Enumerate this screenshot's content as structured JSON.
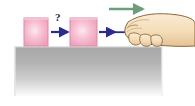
{
  "figure": {
    "background_color": "#ffffff",
    "width": 195,
    "height": 106
  },
  "ground": {
    "name": "surface",
    "label": "",
    "x": 14,
    "y": 46,
    "width": 149,
    "height": 50,
    "color_top": "#a8a8a8",
    "color_bottom": "#ffffff",
    "edge_color": "#d9d9d9"
  },
  "blocks": [
    {
      "id": "block-1",
      "label": "",
      "x": 24,
      "y": 18,
      "width": 24,
      "height": 28,
      "fill": "#f3a8bf",
      "highlight": "#fde3ec",
      "stroke": "#d98ba8"
    },
    {
      "id": "block-2",
      "label": "",
      "x": 70,
      "y": 18,
      "width": 27,
      "height": 28,
      "fill": "#f3a8bf",
      "highlight": "#fde3ec",
      "stroke": "#d98ba8"
    }
  ],
  "force_arrows": [
    {
      "id": "arrow-force-on-block-1",
      "label": "",
      "x1": 50,
      "x2": 70,
      "y": 32,
      "color": "#2b2b8c",
      "direction": "right"
    },
    {
      "id": "arrow-force-on-block-2",
      "label": "",
      "x1": 98,
      "x2": 118,
      "y": 32,
      "color": "#2b2b8c",
      "direction": "right"
    }
  ],
  "motion_arrow": {
    "id": "arrow-motion",
    "label": "",
    "x1": 109,
    "x2": 146,
    "y": 9,
    "color": "#6e9e77",
    "direction": "right"
  },
  "annotations": {
    "question_mark": "?"
  },
  "hand": {
    "id": "hand",
    "label": "",
    "skin_fill": "#f6e0c0",
    "skin_shade": "#e8c99c",
    "outline": "#8a6a3a",
    "rod_color": "#2b2b8c"
  }
}
